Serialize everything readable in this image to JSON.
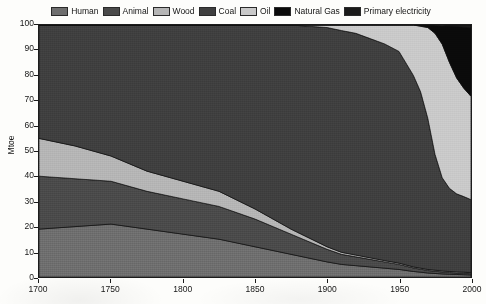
{
  "chart_data": {
    "type": "area",
    "title": "",
    "xlabel": "",
    "ylabel": "Mtoe",
    "xlim": [
      1700,
      2000
    ],
    "ylim": [
      0,
      100
    ],
    "grid": false,
    "legend_position": "top-center",
    "stacked": true,
    "normalized_percent": true,
    "x": [
      1700,
      1725,
      1750,
      1775,
      1800,
      1825,
      1850,
      1875,
      1900,
      1910,
      1920,
      1930,
      1940,
      1950,
      1960,
      1965,
      1970,
      1975,
      1980,
      1985,
      1990,
      1995,
      2000
    ],
    "xticks": [
      1700,
      1750,
      1800,
      1850,
      1900,
      1950,
      2000
    ],
    "yticks": [
      0,
      10,
      20,
      30,
      40,
      50,
      60,
      70,
      80,
      90,
      100
    ],
    "series": [
      {
        "name": "Human",
        "color": "#6e6e6e",
        "values": [
          19,
          20,
          21,
          19,
          17,
          15,
          12,
          9,
          6,
          5,
          4.5,
          4,
          3.5,
          3,
          2.2,
          1.9,
          1.6,
          1.4,
          1.2,
          1.1,
          1.0,
          0.9,
          0.8
        ]
      },
      {
        "name": "Animal",
        "color": "#4a4a4a",
        "values": [
          21,
          19,
          17,
          15,
          14,
          13,
          11,
          8,
          5,
          4,
          3.5,
          3,
          2.5,
          2,
          1.4,
          1.2,
          1.0,
          0.9,
          0.8,
          0.7,
          0.6,
          0.6,
          0.5
        ]
      },
      {
        "name": "Wood",
        "color": "#b5b5b5",
        "values": [
          15,
          13,
          10,
          8,
          7,
          6,
          4,
          2,
          1,
          0.8,
          0.7,
          0.6,
          0.5,
          0.5,
          0.4,
          0.4,
          0.4,
          0.4,
          0.4,
          0.4,
          0.4,
          0.4,
          0.4
        ]
      },
      {
        "name": "Coal",
        "color": "#3f3f3f",
        "values": [
          45,
          48,
          52,
          58,
          62,
          66,
          73,
          81,
          87,
          88,
          88,
          87,
          86,
          84,
          76,
          70,
          60,
          46,
          37,
          33,
          31,
          30,
          29
        ]
      },
      {
        "name": "Oil",
        "color": "#c9c9c9",
        "values": [
          0,
          0,
          0,
          0,
          0,
          0,
          0,
          0,
          1,
          2.2,
          3.3,
          5.4,
          7.5,
          10.5,
          20,
          26,
          36,
          48,
          53,
          50,
          46,
          43,
          41
        ]
      },
      {
        "name": "Natural Gas",
        "color": "#0a0a0a",
        "values": [
          0,
          0,
          0,
          0,
          0,
          0,
          0,
          0,
          0,
          0,
          0,
          0,
          0,
          0,
          0,
          0.5,
          1,
          3,
          7.2,
          14.4,
          20.5,
          24.2,
          27.1
        ]
      },
      {
        "name": "Primary electricity",
        "color": "#1a1a1a",
        "values": [
          0,
          0,
          0,
          0,
          0,
          0,
          0,
          0,
          0,
          0,
          0,
          0,
          0,
          0,
          0,
          0,
          0,
          0,
          0,
          0.4,
          0.5,
          0.9,
          1.2
        ]
      }
    ]
  },
  "legend": {
    "items": [
      {
        "label": "Human",
        "color": "#6e6e6e"
      },
      {
        "label": "Animal",
        "color": "#4a4a4a"
      },
      {
        "label": "Wood",
        "color": "#b5b5b5"
      },
      {
        "label": "Coal",
        "color": "#3f3f3f"
      },
      {
        "label": "Oil",
        "color": "#c9c9c9"
      },
      {
        "label": "Natural Gas",
        "color": "#0a0a0a"
      },
      {
        "label": "Primary electricity",
        "color": "#1a1a1a"
      }
    ]
  },
  "axes": {
    "y_label": "Mtoe",
    "y_ticks": [
      "0",
      "10",
      "20",
      "30",
      "40",
      "50",
      "60",
      "70",
      "80",
      "90",
      "100"
    ],
    "x_ticks": [
      "1700",
      "1750",
      "1800",
      "1850",
      "1900",
      "1950",
      "2000"
    ]
  }
}
